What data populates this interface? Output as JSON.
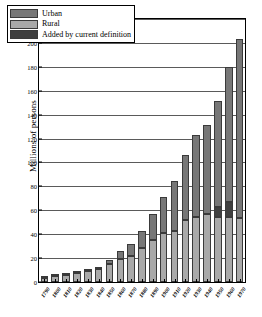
{
  "chart_data": {
    "type": "bar",
    "stacked": true,
    "title": "",
    "xlabel": "",
    "ylabel": "Millions of persons",
    "ylim": [
      0,
      220
    ],
    "ytick_step": 20,
    "yticks": [
      0,
      20,
      40,
      60,
      80,
      100,
      120,
      140,
      160,
      180,
      200,
      220
    ],
    "grid": true,
    "legend_position": "top-left",
    "categories": [
      "1790",
      "1800",
      "1810",
      "1820",
      "1830",
      "1840",
      "1850",
      "1860",
      "1870",
      "1880",
      "1890",
      "1900",
      "1910",
      "1920",
      "1930",
      "1940",
      "1950",
      "1960",
      "1970"
    ],
    "series": [
      {
        "name": "Rural",
        "color": "#a9a9a9",
        "values": [
          3.7,
          4.9,
          6.0,
          7.7,
          8.9,
          11.0,
          15.2,
          19.6,
          22.0,
          28.7,
          34.8,
          41.0,
          42.4,
          51.8,
          54.0,
          57.2,
          54.2,
          54.1,
          53.9
        ]
      },
      {
        "name": "Urban",
        "color": "#777777",
        "values": [
          0.2,
          0.3,
          0.5,
          0.7,
          1.1,
          1.8,
          3.5,
          6.2,
          9.9,
          14.1,
          22.1,
          30.2,
          42.0,
          54.2,
          69.0,
          74.4,
          88.9,
          112.4,
          149.3
        ]
      },
      {
        "name": "Added by current definition",
        "color": "#3f3f3f",
        "values": [
          0,
          0,
          0,
          0,
          0,
          0,
          0,
          0,
          0,
          0,
          0,
          0,
          0,
          0,
          0,
          0,
          8.2,
          13.0,
          0
        ]
      }
    ],
    "totals": [
      3.9,
      5.3,
      7.2,
      9.6,
      12.9,
      17.1,
      23.2,
      31.4,
      38.6,
      50.2,
      62.9,
      76.0,
      92.0,
      105.7,
      122.8,
      131.7,
      150.7,
      179.3,
      203.2
    ],
    "legend": [
      {
        "label": "Urban",
        "color": "#777777"
      },
      {
        "label": "Rural",
        "color": "#a9a9a9"
      },
      {
        "label": "Added by current definition",
        "color": "#3f3f3f"
      }
    ]
  }
}
